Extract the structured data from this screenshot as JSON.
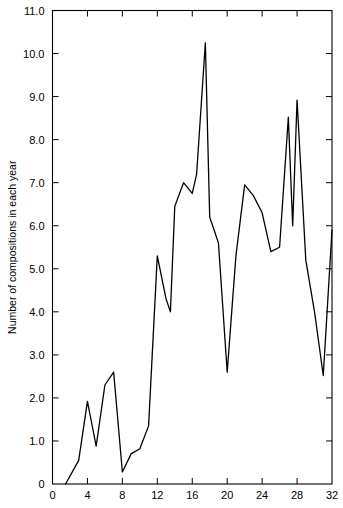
{
  "chart_data": {
    "type": "line",
    "title": "",
    "subtitle": "",
    "xlabel": "",
    "ylabel": "Number of compositions in each year",
    "xlim": [
      0,
      32
    ],
    "ylim": [
      0,
      11.0
    ],
    "grid": false,
    "legend": null,
    "x_ticks": [
      0,
      4,
      8,
      12,
      16,
      20,
      24,
      28,
      32
    ],
    "x_tick_labels": [
      "0",
      "4",
      "8",
      "12",
      "16",
      "20",
      "24",
      "28",
      "32"
    ],
    "y_ticks": [
      0,
      1.0,
      2.0,
      3.0,
      4.0,
      5.0,
      6.0,
      7.0,
      8.0,
      9.0,
      10.0,
      11.0
    ],
    "y_tick_labels": [
      "0",
      "1.0",
      "2.0",
      "3.0",
      "4.0",
      "5.0",
      "6.0",
      "7.0",
      "8.0",
      "9.0",
      "10.0",
      "11.0"
    ],
    "line_color": "#000000",
    "line_width": 1.3,
    "axis_color": "#000000",
    "background_color": "#ffffff",
    "x": [
      1.5,
      3.0,
      4.0,
      5.0,
      6.0,
      7.0,
      8.0,
      9.0,
      10.0,
      11.0,
      12.0,
      13.0,
      13.5,
      14.0,
      15.0,
      16.0,
      16.5,
      17.5,
      18.0,
      18.5,
      19.0,
      20.0,
      21.0,
      22.0,
      23.0,
      24.0,
      25.0,
      26.0,
      27.0,
      27.5,
      28.0,
      29.0,
      30.0,
      31.0,
      32.0
    ],
    "y": [
      0.0,
      0.55,
      1.92,
      0.88,
      2.3,
      2.6,
      0.28,
      0.7,
      0.82,
      1.35,
      5.3,
      4.3,
      4.0,
      6.45,
      7.0,
      6.75,
      7.2,
      10.25,
      6.2,
      5.9,
      5.6,
      2.6,
      5.3,
      6.95,
      6.7,
      6.3,
      5.4,
      5.5,
      8.52,
      6.0,
      8.92,
      5.2,
      4.0,
      2.52,
      5.9
    ],
    "points": [
      {
        "x": 1.5,
        "y": 0.0
      },
      {
        "x": 3.0,
        "y": 0.55
      },
      {
        "x": 4.0,
        "y": 1.92
      },
      {
        "x": 5.0,
        "y": 0.88
      },
      {
        "x": 6.0,
        "y": 2.3
      },
      {
        "x": 7.0,
        "y": 2.6
      },
      {
        "x": 8.0,
        "y": 0.28
      },
      {
        "x": 9.0,
        "y": 0.7
      },
      {
        "x": 10.0,
        "y": 0.82
      },
      {
        "x": 11.0,
        "y": 1.35
      },
      {
        "x": 12.0,
        "y": 5.3
      },
      {
        "x": 13.0,
        "y": 4.3
      },
      {
        "x": 13.5,
        "y": 4.0
      },
      {
        "x": 14.0,
        "y": 6.45
      },
      {
        "x": 15.0,
        "y": 7.0
      },
      {
        "x": 16.0,
        "y": 6.75
      },
      {
        "x": 16.5,
        "y": 7.2
      },
      {
        "x": 17.5,
        "y": 10.25
      },
      {
        "x": 18.0,
        "y": 6.2
      },
      {
        "x": 18.5,
        "y": 5.9
      },
      {
        "x": 19.0,
        "y": 5.6
      },
      {
        "x": 20.0,
        "y": 2.6
      },
      {
        "x": 21.0,
        "y": 5.3
      },
      {
        "x": 22.0,
        "y": 6.95
      },
      {
        "x": 23.0,
        "y": 6.7
      },
      {
        "x": 24.0,
        "y": 6.3
      },
      {
        "x": 25.0,
        "y": 5.4
      },
      {
        "x": 26.0,
        "y": 5.5
      },
      {
        "x": 27.0,
        "y": 8.52
      },
      {
        "x": 27.5,
        "y": 6.0
      },
      {
        "x": 28.0,
        "y": 8.92
      },
      {
        "x": 29.0,
        "y": 5.2
      },
      {
        "x": 30.0,
        "y": 4.0
      },
      {
        "x": 31.0,
        "y": 2.52
      },
      {
        "x": 32.0,
        "y": 5.9
      }
    ]
  }
}
